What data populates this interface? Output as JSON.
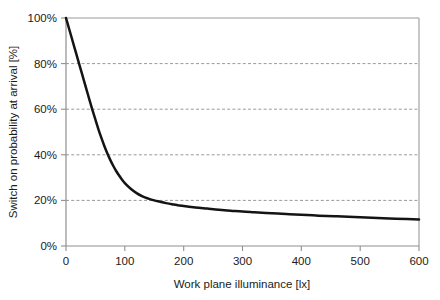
{
  "chart_data": {
    "type": "line",
    "title": "",
    "xlabel": "Work plane illuminance [lx]",
    "ylabel": "Switch on probability at arrival [%]",
    "xlim": [
      0,
      600
    ],
    "ylim": [
      0,
      100
    ],
    "grid": true,
    "legend": "none",
    "xticks": [
      0,
      100,
      200,
      300,
      400,
      500,
      600
    ],
    "xtick_labels": [
      "0",
      "100",
      "200",
      "300",
      "400",
      "500",
      "600"
    ],
    "yticks": [
      0,
      20,
      40,
      60,
      80,
      100
    ],
    "ytick_labels": [
      "0%",
      "20%",
      "40%",
      "60%",
      "80%",
      "100%"
    ],
    "series": [
      {
        "name": "Switch on probability",
        "color": "#141414",
        "x": [
          0,
          5,
          10,
          15,
          20,
          25,
          30,
          35,
          40,
          45,
          50,
          55,
          60,
          65,
          70,
          75,
          80,
          85,
          90,
          95,
          100,
          110,
          120,
          130,
          140,
          150,
          160,
          170,
          180,
          190,
          200,
          220,
          240,
          260,
          280,
          300,
          320,
          340,
          360,
          380,
          400,
          430,
          460,
          490,
          520,
          550,
          580,
          600
        ],
        "values": [
          100,
          95.5,
          91,
          86.5,
          82,
          77.5,
          73,
          68.5,
          64,
          59.6,
          55.4,
          51.3,
          47.5,
          44,
          40.8,
          37.9,
          35.3,
          33,
          31,
          29.2,
          27.6,
          25.1,
          23.2,
          21.8,
          20.8,
          20,
          19.4,
          18.8,
          18.3,
          17.9,
          17.5,
          16.9,
          16.4,
          15.9,
          15.5,
          15.1,
          14.8,
          14.5,
          14.2,
          13.9,
          13.7,
          13.3,
          13,
          12.7,
          12.4,
          12.1,
          11.8,
          11.6
        ]
      }
    ],
    "annotations": []
  },
  "axes": {
    "x_title": "Work plane illuminance [lx]",
    "y_title": "Switch on probability at arrival [%]"
  },
  "colors": {
    "curve": "#141414",
    "grid": "#9a9a9a",
    "border": "#9a9a9a",
    "background": "#ffffff",
    "text": "#1b1b1b"
  }
}
